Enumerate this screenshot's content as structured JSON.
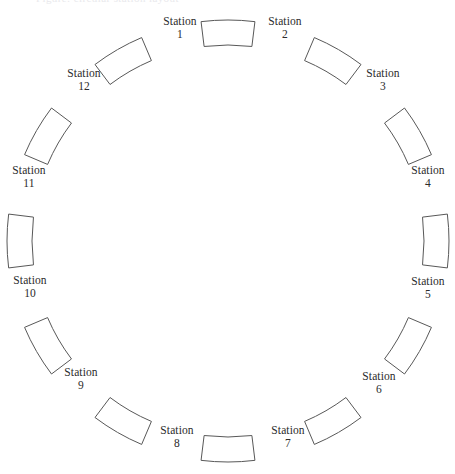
{
  "figure": {
    "title_clipped": "Figure: circular station layout",
    "background_color": "#ffffff",
    "stroke_color": "#585858",
    "text_color": "#2b2b2b",
    "stroke_width": 1,
    "width": 455,
    "height": 474
  },
  "layout": {
    "type": "radial-ring",
    "center_x": 228,
    "center_y": 241,
    "inner_radius": 196,
    "outer_radius": 221,
    "block_span_degrees": 14,
    "station_count": 12,
    "label_radius": 245
  },
  "stations": [
    {
      "id": 1,
      "name": "Station",
      "number": "1",
      "angle_deg": -90,
      "label_x": 180,
      "label_y": 28,
      "block_angle_deg": -90
    },
    {
      "id": 2,
      "name": "Station",
      "number": "2",
      "angle_deg": -60,
      "label_x": 285,
      "label_y": 28,
      "block_angle_deg": -60
    },
    {
      "id": 3,
      "name": "Station",
      "number": "3",
      "angle_deg": -30,
      "label_x": 383,
      "label_y": 80,
      "block_angle_deg": -30
    },
    {
      "id": 4,
      "name": "Station",
      "number": "4",
      "angle_deg": 0,
      "label_x": 428,
      "label_y": 177,
      "block_angle_deg": 0
    },
    {
      "id": 5,
      "name": "Station",
      "number": "5",
      "angle_deg": 30,
      "label_x": 428,
      "label_y": 288,
      "block_angle_deg": 30
    },
    {
      "id": 6,
      "name": "Station",
      "number": "6",
      "angle_deg": 60,
      "label_x": 379,
      "label_y": 383,
      "block_angle_deg": 60
    },
    {
      "id": 7,
      "name": "Station",
      "number": "7",
      "angle_deg": 90,
      "label_x": 288,
      "label_y": 437,
      "block_angle_deg": 90
    },
    {
      "id": 8,
      "name": "Station",
      "number": "8",
      "angle_deg": 120,
      "label_x": 177,
      "label_y": 437,
      "block_angle_deg": 120
    },
    {
      "id": 9,
      "name": "Station",
      "number": "9",
      "angle_deg": 150,
      "label_x": 81,
      "label_y": 379,
      "block_angle_deg": 150
    },
    {
      "id": 10,
      "name": "Station",
      "number": "10",
      "angle_deg": 180,
      "label_x": 30,
      "label_y": 287,
      "block_angle_deg": 180
    },
    {
      "id": 11,
      "name": "Station",
      "number": "11",
      "angle_deg": 210,
      "label_x": 29,
      "label_y": 177,
      "block_angle_deg": 210
    },
    {
      "id": 12,
      "name": "Station",
      "number": "12",
      "angle_deg": 240,
      "label_x": 84,
      "label_y": 80,
      "block_angle_deg": 240
    }
  ]
}
